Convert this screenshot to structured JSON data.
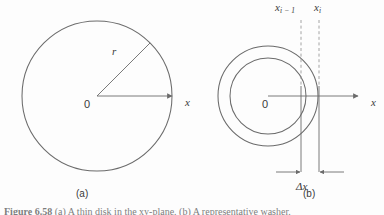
{
  "figure": {
    "panels": [
      {
        "key": "a",
        "tag": "(a)",
        "kind": "disk",
        "labels": {
          "origin": "0",
          "axis_x": "x",
          "radius": "r"
        }
      },
      {
        "key": "b",
        "tag": "(b)",
        "kind": "washer",
        "labels": {
          "origin": "0",
          "axis_x": "x",
          "x_left_base": "x",
          "x_left_sub": "i − 1",
          "x_right_base": "x",
          "x_right_sub": "i",
          "width": "Δx"
        }
      }
    ],
    "caption": {
      "number": "Figure 6.58",
      "text": "(a) A thin disk in the xy-plane. (b) A representative washer."
    },
    "colors": {
      "stroke": "#6b6b6b",
      "axis": "#6b6b6b",
      "dashed": "#9a9a9a",
      "text": "#3a3a3a",
      "caption": "#7d7d7d",
      "background": "#fdfdfd"
    },
    "geometry": {
      "panel_a": {
        "center_x": 97,
        "center_y": 96,
        "radius": 75,
        "axis_end_x": 172,
        "radius_angle_deg": 45
      },
      "panel_b": {
        "center_x": 268,
        "center_y": 96,
        "outer_radius": 50,
        "inner_radius": 38,
        "axis_end_x": 358,
        "x_left": 301,
        "x_right": 319,
        "dim_line_y": 172
      }
    }
  }
}
